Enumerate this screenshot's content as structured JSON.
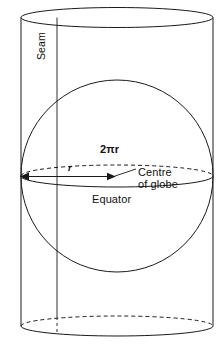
{
  "figure": {
    "name": "globe-inscribed-in-cylinder",
    "background_color": "#ffffff",
    "stroke_color": "#1a1a1a",
    "labels": {
      "seam": "Seam",
      "circumference": "2πr",
      "radius": "r",
      "centre_line1": "Centre",
      "centre_line2": "of globe",
      "equator": "Equator"
    },
    "geometry": {
      "cylinder_left_x": 21,
      "cylinder_right_x": 213,
      "cylinder_top_ellipse_cy": 17.5,
      "cylinder_bottom_ellipse_cy": 326,
      "ellipse_ry": 10,
      "sphere_cx": 117,
      "sphere_cy": 176,
      "sphere_r": 96,
      "equator_ry": 11,
      "seam_x": 57
    }
  }
}
